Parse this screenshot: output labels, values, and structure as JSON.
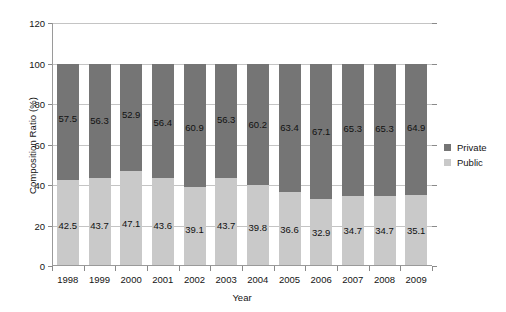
{
  "chart_data": {
    "type": "bar",
    "subtype": "stacked-100-percent",
    "title": "",
    "xlabel": "Year",
    "ylabel": "Composition Ratio (%)",
    "categories": [
      "1998",
      "1999",
      "2000",
      "2001",
      "2002",
      "2003",
      "2004",
      "2005",
      "2006",
      "2007",
      "2008",
      "2009"
    ],
    "series": [
      {
        "name": "Private",
        "color": "#757575",
        "values": [
          57.5,
          56.3,
          52.9,
          56.4,
          60.9,
          56.3,
          60.2,
          63.4,
          67.1,
          65.3,
          65.3,
          64.9
        ]
      },
      {
        "name": "Public",
        "color": "#c9c9c9",
        "values": [
          42.5,
          43.7,
          47.1,
          43.6,
          39.1,
          43.7,
          39.8,
          36.6,
          32.9,
          34.7,
          34.7,
          35.1
        ]
      }
    ],
    "ylim": [
      0,
      120
    ],
    "yticks": [
      0,
      20,
      40,
      60,
      80,
      100,
      120
    ],
    "ytick_labels": [
      "0",
      "20",
      "40",
      "60",
      "80",
      "100",
      "120"
    ],
    "grid": true,
    "grid_axis": "y",
    "legend_position": "right",
    "legend_entries": [
      {
        "label": "Private",
        "color": "#757575"
      },
      {
        "label": "Public",
        "color": "#c9c9c9"
      }
    ],
    "background": "#ffffff",
    "axis_color": "#9a9a9a",
    "gridline_color": "#c4c4c4"
  }
}
